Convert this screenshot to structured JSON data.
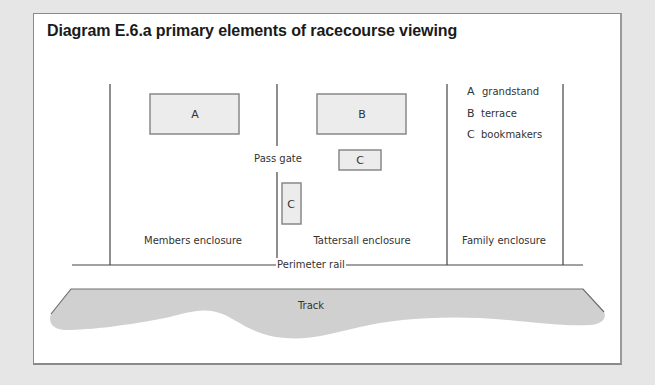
{
  "title": "Diagram E.6.a primary elements of racecourse viewing",
  "colors": {
    "background": "#e6e6e6",
    "panel": "#ffffff",
    "line": "#555555",
    "box_fill": "#ececec",
    "box_stroke": "#888888",
    "track_fill": "#cfcfcf",
    "text": "#333333"
  },
  "boxes": [
    {
      "id": "A",
      "label": "A"
    },
    {
      "id": "B",
      "label": "B"
    },
    {
      "id": "C1",
      "label": "C"
    },
    {
      "id": "C2",
      "label": "C"
    }
  ],
  "legend": [
    {
      "key": "A",
      "label": "grandstand"
    },
    {
      "key": "B",
      "label": "terrace"
    },
    {
      "key": "C",
      "label": "bookmakers"
    }
  ],
  "labels": {
    "pass_gate": "Pass gate",
    "perimeter_rail": "Perimeter rail",
    "track": "Track"
  },
  "enclosures": [
    {
      "label": "Members enclosure"
    },
    {
      "label": "Tattersall enclosure"
    },
    {
      "label": "Family enclosure"
    }
  ]
}
